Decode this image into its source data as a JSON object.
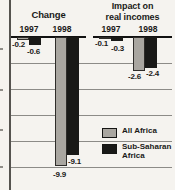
{
  "figure": {
    "kind": "grouped negative bar chart (two panels)",
    "panel_titles": [
      "Change",
      "Impact on real incomes"
    ]
  },
  "colors": {
    "background": "#f5f3ef",
    "bar_all_africa": "#a9a6a0",
    "bar_sub_saharan": "#191917",
    "gridline": "#8c8b87",
    "baseline": "#111111",
    "text": "#1a1a18"
  },
  "chart_data": {
    "type": "bar",
    "orientation": "vertical",
    "ylim": [
      -10,
      0
    ],
    "gridline_step": 2,
    "grid": true,
    "legend_position": "bottom-right",
    "categories": [
      "1997",
      "1998"
    ],
    "panels": [
      {
        "title": "Change",
        "title_lines": [
          "Change"
        ],
        "categories": [
          "1997",
          "1998"
        ],
        "series": [
          {
            "name": "All Africa",
            "values": [
              -0.2,
              -9.9
            ]
          },
          {
            "name": "Sub-Saharan Africa",
            "values": [
              -0.6,
              -9.1
            ]
          }
        ]
      },
      {
        "title": "Impact on real incomes",
        "title_lines": [
          "Impact on",
          "real incomes"
        ],
        "categories": [
          "1997",
          "1998"
        ],
        "series": [
          {
            "name": "All Africa",
            "values": [
              -0.1,
              -2.6
            ]
          },
          {
            "name": "Sub-Saharan Africa",
            "values": [
              -0.3,
              -2.4
            ]
          }
        ]
      }
    ]
  },
  "legend": {
    "items": [
      {
        "label": "All Africa",
        "lines": [
          "All Africa"
        ],
        "series_key": "all_africa"
      },
      {
        "label": "Sub-Saharan Africa",
        "lines": [
          "Sub-Saharan",
          "Africa"
        ],
        "series_key": "sub_saharan"
      }
    ]
  }
}
